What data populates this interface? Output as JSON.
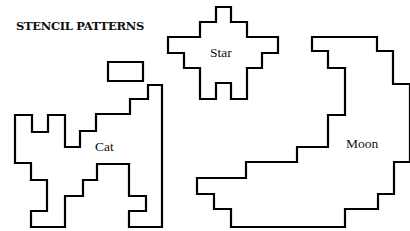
{
  "title": "STENCIL PATTERNS",
  "colors": {
    "background": "#ffffff",
    "outline": "#000000",
    "text": "#111111"
  },
  "shapes": [
    {
      "name": "Cat",
      "label": "Cat",
      "label_pos": [
        95,
        151
      ],
      "points": [
        [
          15,
          115
        ],
        [
          32,
          115
        ],
        [
          32,
          132
        ],
        [
          48,
          132
        ],
        [
          48,
          115
        ],
        [
          65,
          115
        ],
        [
          65,
          147
        ],
        [
          80,
          147
        ],
        [
          80,
          131
        ],
        [
          96,
          131
        ],
        [
          96,
          114
        ],
        [
          130,
          114
        ],
        [
          130,
          99
        ],
        [
          148,
          99
        ],
        [
          148,
          85
        ],
        [
          162,
          85
        ],
        [
          162,
          227
        ],
        [
          129,
          227
        ],
        [
          129,
          211
        ],
        [
          146,
          211
        ],
        [
          146,
          196
        ],
        [
          129,
          196
        ],
        [
          129,
          164
        ],
        [
          97,
          164
        ],
        [
          97,
          180
        ],
        [
          83,
          180
        ],
        [
          83,
          196
        ],
        [
          65,
          196
        ],
        [
          65,
          227
        ],
        [
          31,
          227
        ],
        [
          31,
          211
        ],
        [
          47,
          211
        ],
        [
          47,
          180
        ],
        [
          31,
          180
        ],
        [
          31,
          163
        ],
        [
          15,
          163
        ]
      ]
    },
    {
      "name": "Cat ear",
      "label": "",
      "points": [
        [
          108,
          62
        ],
        [
          143,
          62
        ],
        [
          143,
          81
        ],
        [
          108,
          81
        ]
      ]
    },
    {
      "name": "Star",
      "label": "Star",
      "label_pos": [
        210,
        57
      ],
      "points": [
        [
          216,
          7
        ],
        [
          231,
          7
        ],
        [
          231,
          22
        ],
        [
          247,
          22
        ],
        [
          247,
          37
        ],
        [
          278,
          37
        ],
        [
          278,
          53
        ],
        [
          262,
          53
        ],
        [
          262,
          68
        ],
        [
          247,
          68
        ],
        [
          247,
          99
        ],
        [
          231,
          99
        ],
        [
          231,
          83
        ],
        [
          216,
          83
        ],
        [
          216,
          99
        ],
        [
          200,
          99
        ],
        [
          200,
          68
        ],
        [
          184,
          68
        ],
        [
          184,
          53
        ],
        [
          168,
          53
        ],
        [
          168,
          37
        ],
        [
          200,
          37
        ],
        [
          200,
          22
        ],
        [
          216,
          22
        ]
      ]
    },
    {
      "name": "Moon",
      "label": "Moon",
      "label_pos": [
        346,
        148
      ],
      "points": [
        [
          312,
          37
        ],
        [
          377,
          37
        ],
        [
          377,
          51
        ],
        [
          393,
          51
        ],
        [
          393,
          84
        ],
        [
          410,
          84
        ],
        [
          410,
          162
        ],
        [
          394,
          162
        ],
        [
          394,
          194
        ],
        [
          378,
          194
        ],
        [
          378,
          209
        ],
        [
          345,
          209
        ],
        [
          345,
          227
        ],
        [
          231,
          227
        ],
        [
          231,
          209
        ],
        [
          214,
          209
        ],
        [
          214,
          194
        ],
        [
          197,
          194
        ],
        [
          197,
          178
        ],
        [
          246,
          178
        ],
        [
          246,
          162
        ],
        [
          297,
          162
        ],
        [
          297,
          147
        ],
        [
          328,
          147
        ],
        [
          328,
          115
        ],
        [
          345,
          115
        ],
        [
          345,
          68
        ],
        [
          328,
          68
        ],
        [
          328,
          51
        ],
        [
          312,
          51
        ]
      ]
    }
  ]
}
